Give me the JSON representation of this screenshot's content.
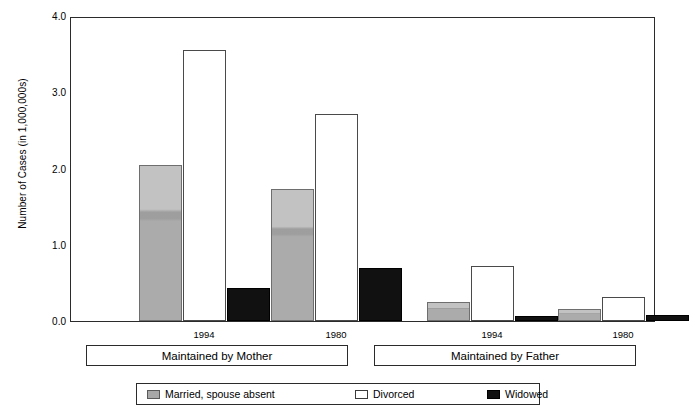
{
  "chart_data": {
    "type": "bar",
    "title": "",
    "xlabel": "",
    "ylabel": "Number of Cases (in 1,000,000s)",
    "ylim": [
      0.0,
      4.0
    ],
    "ytick_major_step": 1.0,
    "ytick_minor_step": 0.5,
    "ytick_labels": [
      "4.0",
      "3.0",
      "2.0",
      "1.0",
      "0.0"
    ],
    "ytick_values": [
      4.0,
      3.0,
      2.0,
      1.0,
      0.0
    ],
    "yminor_values": [
      3.5,
      2.5,
      1.5,
      0.5
    ],
    "grid": false,
    "legend_position": "bottom",
    "categories": [
      "1994",
      "1980",
      "1994",
      "1980"
    ],
    "groups": [
      {
        "label": "Maintained by Mother",
        "categories": [
          "1994",
          "1980"
        ]
      },
      {
        "label": "Maintained by Father",
        "categories": [
          "1994",
          "1980"
        ]
      }
    ],
    "series": [
      {
        "name": "Married, spouse absent",
        "color": "#a8a8a8",
        "values": [
          2.05,
          1.73,
          0.25,
          0.16
        ]
      },
      {
        "name": "Divorced",
        "color": "#ffffff",
        "values": [
          3.55,
          2.71,
          0.72,
          0.32
        ]
      },
      {
        "name": "Widowed",
        "color": "#111111",
        "values": [
          0.43,
          0.69,
          0.06,
          0.08
        ]
      }
    ]
  },
  "axis": {
    "y_title": "Number of Cases (in 1,000,000s)",
    "ticks": [
      {
        "label": "4.0",
        "value": 4.0
      },
      {
        "label": "3.0",
        "value": 3.0
      },
      {
        "label": "2.0",
        "value": 2.0
      },
      {
        "label": "1.0",
        "value": 1.0
      },
      {
        "label": "0.0",
        "value": 0.0
      }
    ]
  },
  "groups": [
    {
      "label": "Maintained by Mother",
      "years": [
        "1994",
        "1980"
      ]
    },
    {
      "label": "Maintained by Father",
      "years": [
        "1994",
        "1980"
      ]
    }
  ],
  "legend": {
    "items": [
      {
        "label": "Married, spouse absent",
        "swatch": "married"
      },
      {
        "label": "Divorced",
        "swatch": "divorced"
      },
      {
        "label": "Widowed",
        "swatch": "widowed"
      }
    ]
  }
}
